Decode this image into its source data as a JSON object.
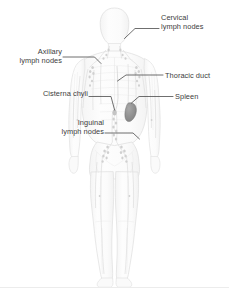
{
  "diagram": {
    "view": "anterior full-body silhouette",
    "background_color": "#ffffff",
    "body_fill": "#fbfbfb",
    "body_stroke": "#e2e2e2",
    "vessel_color": "#dedede",
    "node_color": "#d2d2d2",
    "spleen_color": "#8f8f8f",
    "leader_color": "#4a4a4a",
    "text_color": "#3c3c3c",
    "baseline_rule_color": "#ececec"
  },
  "labels": {
    "cervical": "Cervical\nlymph nodes",
    "axillary": "Axillary\nlymph nodes",
    "cisterna": "Cisterna chyli",
    "inguinal": "Inguinal\nlymph nodes",
    "thoracic": "Thoracic duct",
    "spleen": "Spleen"
  }
}
